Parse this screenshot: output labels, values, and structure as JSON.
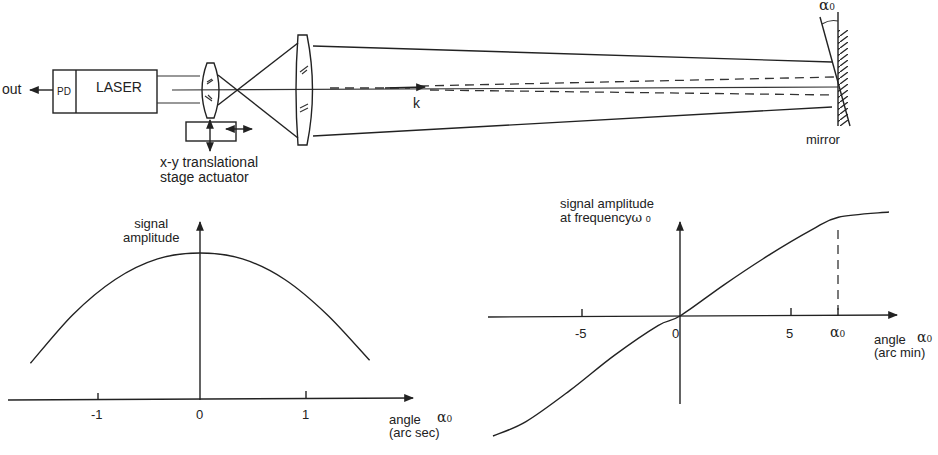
{
  "setup": {
    "out_label": "out",
    "pd_label": "PD",
    "laser_label": "LASER",
    "actuator_label_line1": "x-y translational",
    "actuator_label_line2": "stage actuator",
    "wavevector_label": "k",
    "mirror_label": "mirror",
    "mirror_angle_symbol": "α",
    "mirror_angle_subscript": "0"
  },
  "colors": {
    "line": "#222222",
    "background": "#ffffff"
  },
  "chart_data": [
    {
      "type": "line",
      "title": "",
      "ylabel_line1": "signal",
      "ylabel_line2": "amplitude",
      "xlabel_line1": "angle",
      "xlabel_line2": "(arc sec)",
      "xlabel_symbol": "α",
      "xlabel_subscript": "0",
      "xticks": [
        -1,
        0,
        1
      ],
      "xtick_labels": [
        "-1",
        "0",
        "1"
      ],
      "grid": false,
      "xlim": [
        -1.9,
        2.0
      ],
      "x": [
        -1.6,
        -1.2,
        -0.8,
        -0.4,
        0.0,
        0.4,
        0.8,
        1.2,
        1.6
      ],
      "y": [
        0.25,
        0.58,
        0.82,
        0.96,
        1.0,
        0.96,
        0.82,
        0.58,
        0.27
      ],
      "description": "Bell-shaped (Gaussian-like) curve peaking at angle 0 arc sec"
    },
    {
      "type": "line",
      "title": "",
      "ylabel_line1": "signal amplitude",
      "ylabel_line2": "at frequency",
      "ylabel_symbol": "ω",
      "ylabel_subscript": "0",
      "xlabel_line1": "angle",
      "xlabel_line2": "(arc min)",
      "xlabel_symbol": "α",
      "xlabel_subscript": "0",
      "xticks": [
        -5,
        0,
        5,
        7.2
      ],
      "xtick_labels": [
        "-5",
        "0",
        "5",
        "α0"
      ],
      "alpha0_marker_label": "α",
      "alpha0_marker_subscript": "0",
      "grid": false,
      "xlim": [
        -9,
        10
      ],
      "x": [
        -8.5,
        -7.0,
        -5.0,
        -3.0,
        -1.0,
        0.0,
        2.0,
        4.0,
        6.0,
        7.2,
        9.5
      ],
      "y": [
        -1.0,
        -0.88,
        -0.62,
        -0.33,
        -0.08,
        0.0,
        0.3,
        0.58,
        0.83,
        0.95,
        1.0
      ],
      "description": "S-shaped (odd, sigmoidal) curve through origin, saturating near α0"
    }
  ]
}
